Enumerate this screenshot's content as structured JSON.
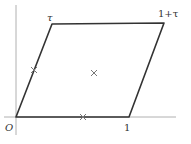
{
  "diagram": {
    "type": "fundamental-parallelogram",
    "axes": {
      "vertical": {
        "x": 16,
        "y1": 5,
        "y2": 135
      },
      "horizontal": {
        "y": 117,
        "x1": 4,
        "x2": 176
      }
    },
    "vertices": {
      "origin": {
        "x": 16,
        "y": 117
      },
      "one": {
        "x": 129,
        "y": 117
      },
      "tau": {
        "x": 52,
        "y": 24
      },
      "one_plus_tau": {
        "x": 164,
        "y": 23
      }
    },
    "labels": {
      "origin": "O",
      "one": "1",
      "tau": "τ",
      "one_plus_tau": "1+τ"
    },
    "crosses": [
      {
        "name": "half-tau",
        "x": 34,
        "y": 70
      },
      {
        "name": "center",
        "x": 94,
        "y": 73
      },
      {
        "name": "half-one",
        "x": 83,
        "y": 117
      }
    ],
    "colors": {
      "outline": "#333333",
      "axis": "#aaaaaa",
      "cross": "#777777",
      "label": "#333333"
    }
  }
}
